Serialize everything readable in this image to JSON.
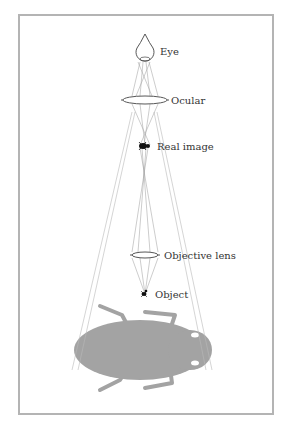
{
  "diagram": {
    "type": "compound-microscope-optical-path",
    "labels": {
      "eye": "Eye",
      "ocular": "Ocular",
      "real_image": "Real image",
      "objective": "Objective lens",
      "object": "Object"
    },
    "colors": {
      "frame": "#b4b4b4",
      "ray": "#9a9a9a",
      "outline": "#444444",
      "virtual_image": "#a3a3a3",
      "text": "#333333"
    }
  }
}
